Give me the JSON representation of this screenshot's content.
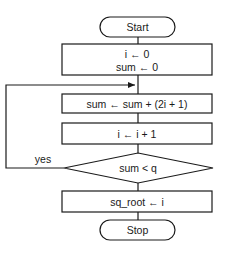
{
  "flowchart": {
    "start": {
      "label": "Start"
    },
    "init": {
      "line1": "i ← 0",
      "line2": "sum ← 0"
    },
    "update_sum": {
      "label": "sum ← sum + (2i + 1)"
    },
    "increment": {
      "label": "i ← i + 1"
    },
    "decision": {
      "label": "sum < q",
      "yes_label": "yes"
    },
    "assign_result": {
      "label": "sq_root ← i"
    },
    "stop": {
      "label": "Stop"
    }
  },
  "colors": {
    "stroke": "#1a1a1a",
    "background": "#ffffff"
  }
}
